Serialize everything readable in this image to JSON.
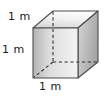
{
  "figure": {
    "type": "geometry-diagram",
    "shape_name": "cube",
    "background_color": "#ffffff",
    "labels": {
      "depth": "1 m",
      "height": "1 m",
      "width": "1 m"
    },
    "colors": {
      "outline": "#4d4d4d",
      "hidden_edge": "#333333",
      "front_face_light": "#f2f2f2",
      "front_face_dark": "#b3b3b3",
      "top_face_light": "#fafafa",
      "top_face_dark": "#d9d9d9",
      "right_face_light": "#d4d4d4",
      "right_face_dark": "#a8a8a8",
      "text": "#1a1a1a"
    },
    "geometry": {
      "front_face": "33,28 78,28 78,78 33,78",
      "top_face": "33,28 53,11 98,11 78,28",
      "right_face": "78,28 98,11 98,62 78,78",
      "hidden_vertex": "53,62",
      "hidden_edges": [
        "53,11 53,62",
        "53,62 33,78",
        "53,62 98,62"
      ]
    }
  }
}
